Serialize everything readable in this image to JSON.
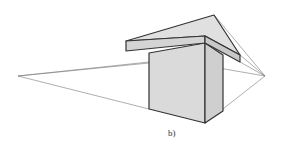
{
  "figure": {
    "label": "b)",
    "colors": {
      "face_fill": "#d9d9d9",
      "edge": "#333333",
      "construction_line": "#777777",
      "background": "#ffffff"
    },
    "vanishing_points": {
      "left": [
        18,
        76
      ],
      "right": [
        265,
        76
      ]
    }
  }
}
